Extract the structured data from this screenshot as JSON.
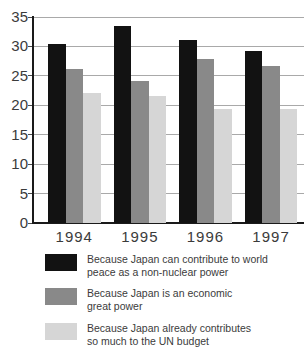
{
  "chart_data": {
    "type": "bar",
    "title": "",
    "xlabel": "",
    "ylabel": "",
    "categories": [
      "1994",
      "1995",
      "1996",
      "1997"
    ],
    "series": [
      {
        "name": "Because Japan can contribute to world peace as a non-nuclear power",
        "label_lines": [
          "Because Japan can contribute to world",
          "peace as a non-nuclear power"
        ],
        "color": "#121212",
        "values": [
          30.4,
          33.5,
          31.1,
          29.3
        ]
      },
      {
        "name": "Because Japan is an economic great power",
        "label_lines": [
          "Because Japan is an economic",
          "great power"
        ],
        "color": "#898989",
        "values": [
          26.2,
          24.1,
          27.8,
          26.7
        ]
      },
      {
        "name": "Because Japan already contributes so much to the UN budget",
        "label_lines": [
          "Because Japan already contributes",
          "so much to the UN budget"
        ],
        "color": "#d6d6d6",
        "values": [
          22.1,
          21.6,
          19.3,
          19.4
        ]
      }
    ],
    "ylim": [
      0,
      35
    ],
    "yticks": [
      0,
      5,
      10,
      15,
      20,
      25,
      30,
      35
    ],
    "grid": true,
    "legend_position": "bottom"
  },
  "colors": {
    "background": "#ffffff",
    "gridline": "#a9a9a9",
    "axis": "#1a1a1a",
    "text": "#3b3b3b"
  }
}
